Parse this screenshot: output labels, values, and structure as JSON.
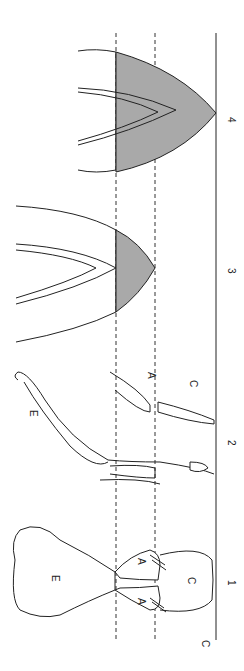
{
  "figure": {
    "orientation": "rotated 90deg (baseline on right)",
    "stage_labels": [
      "1",
      "2",
      "3",
      "4"
    ],
    "part_labels": {
      "A": "A",
      "C": "C",
      "E": "E"
    },
    "colors": {
      "line": "#222222",
      "shade": "#a9a9a9",
      "background": "#ffffff"
    }
  }
}
